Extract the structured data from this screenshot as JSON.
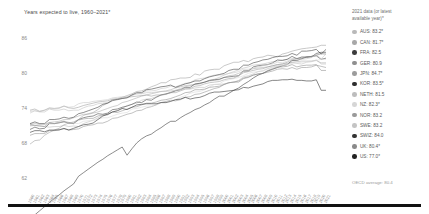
{
  "title": "Years expected to live, 1960–2021*",
  "legend": {
    "header": "2021 data (or latest available year)*",
    "entries": [
      {
        "code": "AUS",
        "label": "AUS: 83.2*",
        "value": 83.2,
        "color": "#b9b9b9"
      },
      {
        "code": "CAN",
        "label": "CAN: 81.7*",
        "value": 81.7,
        "color": "#a8a8a8"
      },
      {
        "code": "FRA",
        "label": "FRA: 82.5",
        "value": 82.5,
        "color": "#3c3c3c"
      },
      {
        "code": "GER",
        "label": "GER: 80.9",
        "value": 80.9,
        "color": "#8f8f8f"
      },
      {
        "code": "JPN",
        "label": "JPN: 84.7*",
        "value": 84.7,
        "color": "#9c9c9c"
      },
      {
        "code": "KOR",
        "label": "KOR: 83.5*",
        "value": 83.5,
        "color": "#2e2e2e"
      },
      {
        "code": "NETH",
        "label": "NETH: 81.5",
        "value": 81.5,
        "color": "#bdbdbd"
      },
      {
        "code": "NZ",
        "label": "NZ: 82.3*",
        "value": 82.3,
        "color": "#d6d6d6"
      },
      {
        "code": "NOR",
        "label": "NOR: 83.2",
        "value": 83.2,
        "color": "#9a9a9a"
      },
      {
        "code": "SWE",
        "label": "SWE: 83.2",
        "value": 83.2,
        "color": "#c4c4c4"
      },
      {
        "code": "SWIZ",
        "label": "SWIZ: 84.0",
        "value": 84.0,
        "color": "#333333"
      },
      {
        "code": "UK",
        "label": "UK: 80.4*",
        "value": 80.4,
        "color": "#8a8a8a"
      },
      {
        "code": "US",
        "label": "US: 77.0*",
        "value": 77.0,
        "color": "#222222"
      }
    ]
  },
  "footnote": "OECD average: 80.4",
  "chart_data": {
    "type": "line",
    "title": "Years expected to live, 1960–2021*",
    "xlabel": "",
    "ylabel": "",
    "ylim": [
      62,
      88
    ],
    "yticks": [
      62,
      68,
      74,
      80,
      86
    ],
    "grid": false,
    "legend_position": "right",
    "x": [
      1960,
      1961,
      1962,
      1963,
      1964,
      1965,
      1966,
      1967,
      1968,
      1969,
      1970,
      1971,
      1972,
      1973,
      1974,
      1975,
      1976,
      1977,
      1978,
      1979,
      1980,
      1981,
      1982,
      1983,
      1984,
      1985,
      1986,
      1987,
      1988,
      1989,
      1990,
      1991,
      1992,
      1993,
      1994,
      1995,
      1996,
      1997,
      1998,
      1999,
      2000,
      2001,
      2002,
      2003,
      2004,
      2005,
      2006,
      2007,
      2008,
      2009,
      2010,
      2011,
      2012,
      2013,
      2014,
      2015,
      2016,
      2017,
      2018,
      2019,
      2020,
      2021
    ],
    "series": [
      {
        "name": "AUS",
        "color": "#b9b9b9",
        "values": [
          70.9,
          71.0,
          70.9,
          70.8,
          70.7,
          70.8,
          70.8,
          71.0,
          70.8,
          70.9,
          70.8,
          71.3,
          71.6,
          71.9,
          72.3,
          72.7,
          72.9,
          73.3,
          73.5,
          73.9,
          74.4,
          74.6,
          74.8,
          75.3,
          75.5,
          75.6,
          75.9,
          76.2,
          76.3,
          76.7,
          77.0,
          77.3,
          77.6,
          77.8,
          78.0,
          78.2,
          78.4,
          78.7,
          78.9,
          79.2,
          79.6,
          79.9,
          80.2,
          80.5,
          80.8,
          81.0,
          81.3,
          81.4,
          81.5,
          81.7,
          81.9,
          82.0,
          82.2,
          82.3,
          82.4,
          82.5,
          82.5,
          82.6,
          82.8,
          83.0,
          83.2,
          83.2
        ]
      },
      {
        "name": "CAN",
        "color": "#a8a8a8",
        "values": [
          71.1,
          71.3,
          71.2,
          71.2,
          71.5,
          71.6,
          71.7,
          72.0,
          72.0,
          72.3,
          72.6,
          72.9,
          72.9,
          73.1,
          73.3,
          73.6,
          73.9,
          74.2,
          74.4,
          74.9,
          75.1,
          75.4,
          75.7,
          76.0,
          76.2,
          76.4,
          76.6,
          76.8,
          76.9,
          77.1,
          77.4,
          77.6,
          77.8,
          77.9,
          78.0,
          78.1,
          78.4,
          78.6,
          78.7,
          78.8,
          79.2,
          79.5,
          79.6,
          79.9,
          80.3,
          80.4,
          80.7,
          80.8,
          80.9,
          81.0,
          81.2,
          81.4,
          81.5,
          81.6,
          81.8,
          81.9,
          82.0,
          82.0,
          82.0,
          82.1,
          81.7,
          81.7
        ]
      },
      {
        "name": "FRA",
        "color": "#3c3c3c",
        "values": [
          70.3,
          70.7,
          70.4,
          70.5,
          71.3,
          71.3,
          71.5,
          71.6,
          71.5,
          71.3,
          72.0,
          72.3,
          72.5,
          72.6,
          73.0,
          72.9,
          73.1,
          73.7,
          73.8,
          74.1,
          74.3,
          74.6,
          75.0,
          74.9,
          75.4,
          75.3,
          75.8,
          76.2,
          76.4,
          76.6,
          76.9,
          77.1,
          77.5,
          77.5,
          78.1,
          78.2,
          78.4,
          78.7,
          78.8,
          78.9,
          79.2,
          79.3,
          79.4,
          79.5,
          80.3,
          80.3,
          81.0,
          81.2,
          81.3,
          81.4,
          81.7,
          82.2,
          82.1,
          82.3,
          82.8,
          82.4,
          82.7,
          82.7,
          82.8,
          82.9,
          82.3,
          82.5
        ]
      },
      {
        "name": "GER",
        "color": "#8f8f8f",
        "values": [
          69.3,
          69.6,
          69.6,
          69.6,
          70.1,
          70.1,
          70.3,
          70.4,
          70.2,
          70.3,
          70.4,
          70.8,
          71.0,
          71.1,
          71.4,
          71.4,
          71.7,
          72.2,
          72.3,
          72.6,
          72.9,
          73.1,
          73.5,
          73.6,
          74.0,
          74.2,
          74.5,
          74.9,
          75.1,
          75.3,
          75.2,
          75.4,
          75.8,
          75.9,
          76.3,
          76.4,
          76.7,
          77.0,
          77.3,
          77.5,
          78.0,
          78.3,
          78.4,
          78.4,
          79.0,
          79.2,
          79.6,
          79.8,
          79.9,
          80.1,
          80.3,
          80.6,
          80.7,
          80.6,
          80.9,
          80.6,
          80.9,
          80.9,
          81.0,
          81.3,
          81.1,
          80.9
        ]
      },
      {
        "name": "JPN",
        "color": "#9c9c9c",
        "values": [
          67.8,
          68.4,
          68.5,
          69.3,
          69.8,
          70.2,
          70.5,
          71.1,
          71.4,
          71.6,
          72.0,
          72.7,
          73.0,
          73.2,
          73.7,
          74.4,
          74.8,
          75.2,
          75.5,
          75.8,
          76.1,
          76.4,
          76.8,
          76.9,
          77.2,
          77.6,
          77.9,
          78.3,
          78.3,
          78.8,
          78.9,
          79.1,
          79.1,
          79.2,
          79.8,
          79.6,
          80.3,
          80.5,
          80.6,
          80.6,
          81.2,
          81.5,
          81.8,
          81.8,
          82.1,
          81.9,
          82.4,
          82.6,
          82.7,
          83.0,
          82.9,
          82.7,
          83.2,
          83.4,
          83.7,
          83.9,
          84.1,
          84.2,
          84.3,
          84.4,
          84.7,
          84.7
        ]
      },
      {
        "name": "KOR",
        "color": "#2e2e2e",
        "values": [
          55.0,
          55.7,
          56.4,
          57.1,
          57.8,
          58.5,
          59.1,
          59.8,
          60.4,
          61.0,
          62.3,
          62.9,
          63.5,
          64.1,
          64.7,
          65.2,
          65.8,
          66.3,
          66.8,
          67.3,
          65.9,
          67.0,
          68.0,
          68.7,
          69.2,
          69.5,
          70.1,
          70.6,
          71.2,
          71.7,
          71.7,
          72.3,
          72.8,
          73.2,
          73.7,
          74.0,
          74.5,
          74.9,
          75.5,
          76.0,
          76.0,
          76.5,
          77.0,
          77.4,
          78.0,
          78.5,
          79.1,
          79.6,
          79.9,
          80.3,
          80.6,
          80.9,
          81.2,
          81.4,
          82.1,
          82.1,
          82.4,
          82.7,
          82.7,
          83.3,
          83.5,
          83.5
        ]
      },
      {
        "name": "NETH",
        "color": "#bdbdbd",
        "values": [
          73.4,
          73.5,
          73.3,
          73.3,
          73.8,
          73.6,
          73.6,
          73.8,
          73.5,
          73.6,
          73.6,
          74.0,
          74.3,
          74.4,
          74.7,
          74.8,
          74.9,
          75.4,
          75.6,
          75.8,
          75.9,
          76.2,
          76.4,
          76.4,
          76.6,
          76.6,
          76.7,
          76.8,
          76.8,
          76.9,
          77.0,
          77.1,
          77.3,
          77.2,
          77.4,
          77.5,
          77.5,
          77.9,
          78.0,
          78.0,
          78.1,
          78.3,
          78.4,
          78.7,
          79.3,
          79.5,
          79.8,
          80.2,
          80.3,
          80.7,
          81.0,
          81.2,
          81.2,
          81.4,
          81.8,
          81.6,
          81.5,
          81.8,
          81.9,
          82.2,
          81.5,
          81.5
        ]
      },
      {
        "name": "NZ",
        "color": "#d6d6d6",
        "values": [
          71.3,
          71.4,
          71.1,
          71.1,
          71.4,
          71.3,
          71.5,
          71.8,
          71.4,
          71.4,
          71.3,
          71.7,
          71.8,
          71.8,
          72.1,
          72.3,
          72.3,
          72.6,
          72.9,
          73.1,
          73.2,
          73.8,
          73.9,
          74.1,
          74.3,
          74.3,
          74.6,
          74.9,
          74.9,
          75.2,
          75.4,
          75.8,
          76.1,
          76.5,
          76.7,
          76.8,
          77.1,
          77.6,
          78.0,
          78.1,
          78.6,
          78.8,
          79.0,
          79.2,
          79.5,
          79.9,
          80.1,
          80.2,
          80.4,
          80.7,
          80.9,
          81.1,
          81.3,
          81.4,
          81.6,
          81.7,
          81.8,
          81.9,
          82.0,
          82.1,
          82.3,
          82.3
        ]
      },
      {
        "name": "NOR",
        "color": "#9a9a9a",
        "values": [
          73.6,
          73.8,
          73.4,
          73.6,
          74.0,
          73.9,
          74.0,
          74.3,
          74.0,
          73.9,
          74.1,
          74.4,
          74.6,
          74.8,
          75.0,
          75.1,
          75.2,
          75.5,
          75.5,
          75.6,
          75.8,
          75.9,
          76.0,
          76.1,
          76.2,
          76.0,
          76.2,
          76.2,
          76.3,
          76.6,
          76.6,
          76.9,
          77.2,
          77.3,
          77.7,
          77.8,
          78.1,
          78.3,
          78.4,
          78.5,
          78.8,
          79.0,
          79.1,
          79.5,
          80.0,
          80.2,
          80.4,
          80.6,
          80.7,
          81.0,
          81.2,
          81.4,
          81.5,
          81.8,
          82.2,
          82.4,
          82.5,
          82.7,
          82.8,
          83.0,
          83.3,
          83.2
        ]
      },
      {
        "name": "SWE",
        "color": "#c4c4c4",
        "values": [
          73.1,
          73.5,
          73.4,
          73.6,
          73.9,
          73.8,
          73.9,
          74.3,
          74.1,
          74.2,
          74.7,
          74.9,
          74.9,
          75.1,
          75.2,
          75.3,
          75.4,
          75.7,
          75.8,
          75.9,
          75.8,
          76.1,
          76.4,
          76.5,
          76.9,
          76.9,
          77.0,
          77.3,
          77.4,
          77.7,
          77.6,
          77.9,
          78.2,
          78.3,
          78.8,
          79.0,
          79.1,
          79.4,
          79.6,
          79.6,
          79.7,
          79.9,
          80.0,
          80.2,
          80.6,
          80.6,
          80.8,
          81.0,
          81.2,
          81.4,
          81.5,
          81.8,
          81.7,
          82.0,
          82.3,
          82.2,
          82.3,
          82.4,
          82.6,
          83.1,
          82.4,
          83.2
        ]
      },
      {
        "name": "SWIZ",
        "color": "#333333",
        "values": [
          71.3,
          71.6,
          71.3,
          71.3,
          72.0,
          72.0,
          72.1,
          72.4,
          72.2,
          72.4,
          73.0,
          73.2,
          73.5,
          73.8,
          74.1,
          74.6,
          74.8,
          75.3,
          75.4,
          75.6,
          75.7,
          76.2,
          76.6,
          76.6,
          77.1,
          77.2,
          77.4,
          77.6,
          77.7,
          77.9,
          77.5,
          77.8,
          78.1,
          78.3,
          78.6,
          78.6,
          79.0,
          79.3,
          79.5,
          79.7,
          79.9,
          80.4,
          80.6,
          80.6,
          81.3,
          81.3,
          81.7,
          81.9,
          82.2,
          82.3,
          82.6,
          82.8,
          82.8,
          82.9,
          83.3,
          83.0,
          83.7,
          83.7,
          83.8,
          84.0,
          83.2,
          84.0
        ]
      },
      {
        "name": "UK",
        "color": "#8a8a8a",
        "values": [
          71.1,
          71.0,
          70.9,
          70.8,
          71.5,
          71.3,
          71.4,
          71.7,
          71.3,
          71.4,
          71.9,
          72.1,
          72.2,
          72.2,
          72.6,
          72.8,
          72.8,
          73.3,
          73.2,
          73.5,
          73.8,
          74.1,
          74.2,
          74.5,
          74.8,
          74.8,
          75.0,
          75.3,
          75.4,
          75.6,
          75.9,
          76.2,
          76.6,
          76.7,
          77.1,
          77.1,
          77.2,
          77.5,
          77.6,
          77.7,
          78.0,
          78.3,
          78.4,
          78.6,
          79.1,
          79.3,
          79.6,
          79.8,
          79.9,
          80.4,
          80.7,
          81.0,
          81.0,
          81.1,
          81.4,
          81.0,
          81.2,
          81.3,
          81.3,
          81.4,
          80.4,
          80.4
        ]
      },
      {
        "name": "US",
        "color": "#222222",
        "values": [
          69.8,
          70.1,
          70.1,
          69.9,
          70.2,
          70.2,
          70.2,
          70.5,
          70.2,
          70.5,
          70.8,
          71.1,
          71.2,
          71.4,
          72.0,
          72.6,
          72.9,
          73.3,
          73.5,
          73.9,
          73.7,
          74.1,
          74.5,
          74.6,
          74.7,
          74.7,
          74.7,
          74.9,
          74.9,
          75.1,
          75.4,
          75.5,
          75.8,
          75.5,
          75.7,
          75.8,
          76.1,
          76.5,
          76.7,
          76.7,
          76.8,
          76.9,
          77.0,
          77.1,
          77.5,
          77.4,
          77.7,
          77.9,
          78.1,
          78.5,
          78.7,
          78.7,
          78.8,
          78.8,
          78.9,
          78.7,
          78.7,
          78.6,
          78.6,
          78.8,
          77.0,
          77.0
        ]
      }
    ]
  }
}
